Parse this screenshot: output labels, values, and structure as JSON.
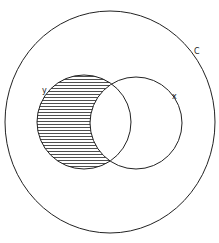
{
  "diagram": {
    "type": "venn",
    "universe": {
      "label": "C",
      "cx": 110,
      "cy": 122,
      "rx": 105,
      "ry": 111
    },
    "sets": [
      {
        "label": "y",
        "cx": 84,
        "cy": 122,
        "r": 47,
        "label_x": 42,
        "label_y": 93
      },
      {
        "label": "x",
        "cx": 136,
        "cy": 123,
        "r": 46,
        "label_x": 172,
        "label_y": 99
      }
    ],
    "shaded_region": "y minus x",
    "shading": "horizontal hatching",
    "stroke_color": "#222222",
    "background_color": "#ffffff"
  }
}
